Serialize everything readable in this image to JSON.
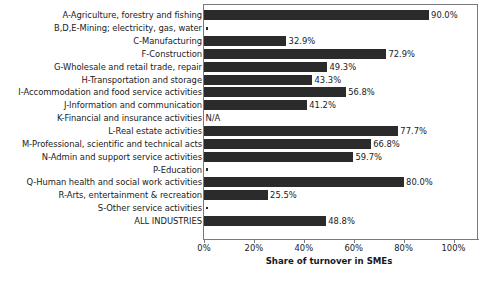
{
  "chart_data": {
    "type": "bar",
    "orientation": "horizontal",
    "title": "",
    "xlabel": "Share of turnover in SMEs",
    "ylabel": "",
    "xlim": [
      0,
      110
    ],
    "xticks": [
      0,
      20,
      40,
      60,
      80,
      100
    ],
    "xtick_labels": [
      "0%",
      "20%",
      "40%",
      "60%",
      "80%",
      "100%"
    ],
    "grid": false,
    "legend": false,
    "bar_color": "#2b2b2b",
    "categories": [
      "A-Agriculture, forestry and fishing",
      "B,D,E-Mining; electricity, gas, water",
      "C-Manufacturing",
      "F-Construction",
      "G-Wholesale and retail trade, repair",
      "H-Transportation and storage",
      "I-Accommodation and food service activities",
      "J-Information and communication",
      "K-Financial and insurance activities",
      "L-Real estate activities",
      "M-Professional, scientific and technical acts",
      "N-Admin and support service activities",
      "P-Education",
      "Q-Human health and social work activities",
      "R-Arts, entertainment & recreation",
      "S-Other service activities",
      "ALL INDUSTRIES"
    ],
    "values": [
      90.0,
      null,
      32.9,
      72.9,
      49.3,
      43.3,
      56.8,
      41.2,
      null,
      77.7,
      66.8,
      59.7,
      null,
      80.0,
      25.5,
      null,
      48.8
    ],
    "value_labels": [
      "90.0%",
      "",
      "32.9%",
      "72.9%",
      "49.3%",
      "43.3%",
      "56.8%",
      "41.2%",
      "N/A",
      "77.7%",
      "66.8%",
      "59.7%",
      "",
      "80.0%",
      "25.5%",
      "",
      "48.8%"
    ],
    "marker_flags": [
      false,
      true,
      false,
      false,
      false,
      false,
      false,
      false,
      false,
      false,
      false,
      false,
      true,
      false,
      false,
      true,
      false
    ],
    "na_flags": [
      false,
      false,
      false,
      false,
      false,
      false,
      false,
      false,
      true,
      false,
      false,
      false,
      false,
      false,
      false,
      false,
      false
    ]
  }
}
